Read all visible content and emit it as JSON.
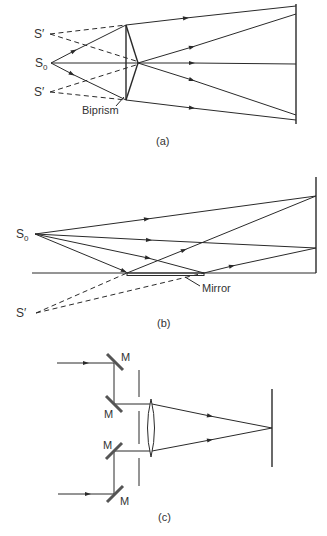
{
  "figure": {
    "panels": [
      {
        "id": "a",
        "caption": "(a)",
        "title": "Fresnel biprism interference",
        "labels": {
          "virtual_source_top": "S′",
          "source": "S",
          "source_sub": "0",
          "virtual_source_bottom": "S′",
          "component": "Biprism"
        }
      },
      {
        "id": "b",
        "caption": "(b)",
        "title": "Lloyd's mirror interference",
        "labels": {
          "source": "S",
          "source_sub": "0",
          "virtual_source": "S′",
          "component": "Mirror"
        }
      },
      {
        "id": "c",
        "caption": "(c)",
        "title": "Mirror and lens beam combination",
        "labels": {
          "mirror_1": "M",
          "mirror_2": "M",
          "mirror_3": "M",
          "mirror_4": "M"
        }
      }
    ]
  }
}
